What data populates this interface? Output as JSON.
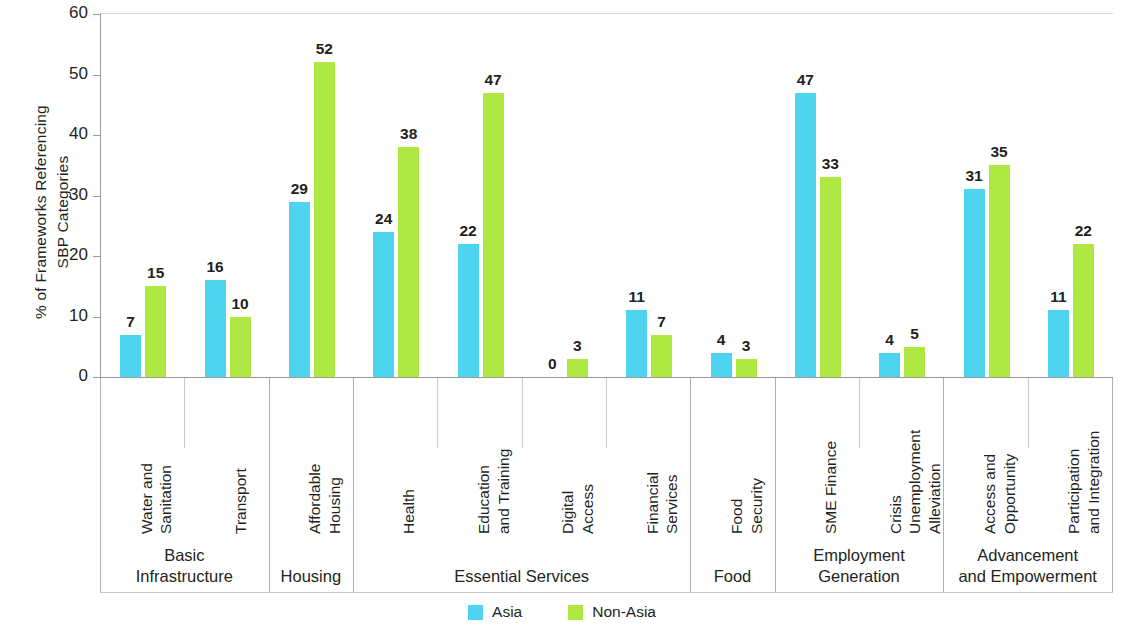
{
  "chart_data": {
    "type": "bar",
    "title": "",
    "xlabel": "",
    "ylabel": "% of Frameworks Referencing\nSBP Categories",
    "ylim": [
      0,
      60
    ],
    "yticks": [
      0,
      10,
      20,
      30,
      40,
      50,
      60
    ],
    "grid": false,
    "legend_position": "bottom-center",
    "categories": [
      "Water and\nSanitation",
      "Transport",
      "Affordable\nHousing",
      "Health",
      "Education\nand Training",
      "Digital\nAccess",
      "Financial\nServices",
      "Food\nSecurity",
      "SME Finance",
      "Crisis\nUnemployment\nAlleviation",
      "Access and\nOpportunity",
      "Participation\nand Integration"
    ],
    "series": [
      {
        "name": "Asia",
        "color": "#4fd4ef",
        "values": [
          7,
          16,
          29,
          24,
          22,
          0,
          11,
          4,
          47,
          4,
          31,
          11
        ]
      },
      {
        "name": "Non-Asia",
        "color": "#b0e843",
        "values": [
          15,
          10,
          52,
          38,
          47,
          3,
          7,
          3,
          33,
          5,
          35,
          22
        ]
      }
    ],
    "groups": [
      {
        "label": "Basic\nInfrastructure",
        "categories": [
          "Water and\nSanitation",
          "Transport"
        ]
      },
      {
        "label": "Housing",
        "categories": [
          "Affordable\nHousing"
        ]
      },
      {
        "label": "Essential Services",
        "categories": [
          "Health",
          "Education\nand Training",
          "Digital\nAccess",
          "Financial\nServices"
        ]
      },
      {
        "label": "Food",
        "categories": [
          "Food\nSecurity"
        ]
      },
      {
        "label": "Employment\nGeneration",
        "categories": [
          "SME Finance",
          "Crisis\nUnemployment\nAlleviation"
        ]
      },
      {
        "label": "Advancement\nand Empowerment",
        "categories": [
          "Access and\nOpportunity",
          "Participation\nand Integration"
        ]
      }
    ]
  },
  "legend": {
    "items": [
      {
        "label": "Asia",
        "color": "#4fd4ef"
      },
      {
        "label": "Non-Asia",
        "color": "#b0e843"
      }
    ]
  }
}
